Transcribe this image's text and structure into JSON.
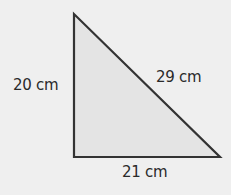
{
  "diagram": {
    "shape": "right triangle",
    "colors": {
      "background": "#efefef",
      "fill": "#e4e4e4",
      "stroke": "#333333"
    },
    "vertices": [
      [
        74,
        14
      ],
      [
        74,
        157
      ],
      [
        220,
        157
      ]
    ],
    "labels": {
      "left_side": "20 cm",
      "hypotenuse": "29 cm",
      "bottom_side": "21 cm"
    }
  }
}
